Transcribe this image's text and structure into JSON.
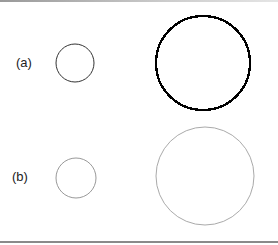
{
  "labels": {
    "a": "(a)",
    "b": "(b)"
  },
  "figure": {
    "rows": [
      {
        "label": "(a)",
        "circles": [
          {
            "cx": 75,
            "cy": 63,
            "r": 19,
            "stroke": "#333333",
            "stroke_width": 1,
            "style": "smooth"
          },
          {
            "cx": 203,
            "cy": 63,
            "r": 47,
            "stroke": "#000000",
            "stroke_width": 2.4,
            "style": "pixelated"
          }
        ]
      },
      {
        "label": "(b)",
        "circles": [
          {
            "cx": 76,
            "cy": 178,
            "r": 20,
            "stroke": "#999999",
            "stroke_width": 1,
            "style": "smooth"
          },
          {
            "cx": 205,
            "cy": 176,
            "r": 49,
            "stroke": "#aaaaaa",
            "stroke_width": 1,
            "style": "smooth"
          }
        ]
      }
    ]
  }
}
